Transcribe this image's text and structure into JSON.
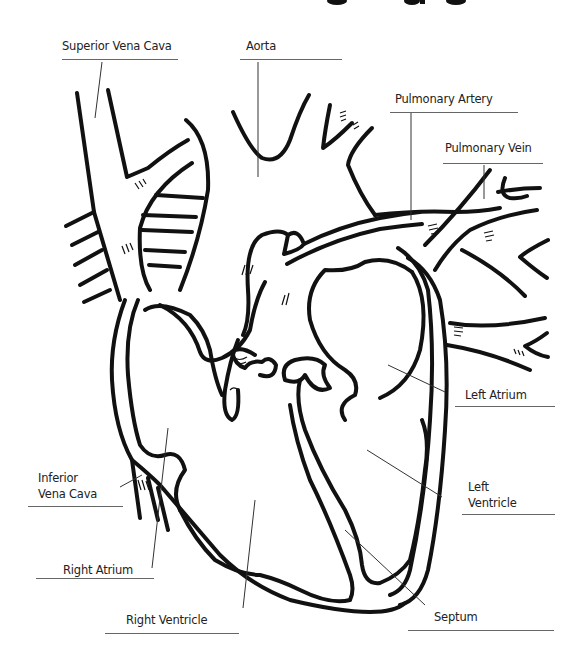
{
  "title_fragment": "(title cut off at top edge)",
  "colors": {
    "ink": "#111111",
    "leader": "#333333",
    "underline": "#666666",
    "background": "#ffffff"
  },
  "labels": {
    "superior_vena_cava": "Superior Vena Cava",
    "aorta": "Aorta",
    "pulmonary_artery": "Pulmonary Artery",
    "pulmonary_vein": "Pulmonary Vein",
    "left_atrium": "Left Atrium",
    "left_ventricle_line1": "Left",
    "left_ventricle_line2": "Ventricle",
    "inferior_vena_cava_line1": "Inferior",
    "inferior_vena_cava_line2": "Vena Cava",
    "right_atrium": "Right Atrium",
    "right_ventricle": "Right Ventricle",
    "septum": "Septum"
  }
}
